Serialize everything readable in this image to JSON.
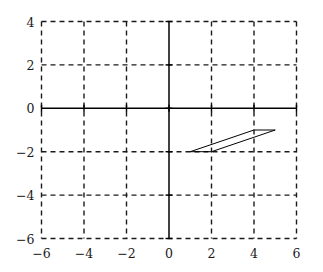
{
  "chart_data": {
    "type": "line",
    "title": "",
    "xlabel": "",
    "ylabel": "",
    "xlim": [
      -6,
      6
    ],
    "ylim": [
      -6,
      4
    ],
    "grid": true,
    "grid_style": "dashed",
    "grid_spacing": 2,
    "legend": "none",
    "axes_style": "solid-through-origin",
    "xticks": [
      -6,
      -4,
      -2,
      0,
      2,
      4,
      6
    ],
    "xtick_labels": [
      "−6",
      "−4",
      "−2",
      "0",
      "2",
      "4",
      "6"
    ],
    "yticks": [
      -6,
      -4,
      -2,
      0,
      2,
      4
    ],
    "ytick_labels": [
      "−6",
      "−4",
      "−2",
      "0",
      "2",
      "4"
    ],
    "series": [
      {
        "name": "parallelogram",
        "shape": "closed-polygon",
        "fill": "none",
        "stroke": "#000000",
        "stroke_width": 1,
        "points": [
          [
            1,
            -2
          ],
          [
            4,
            -1
          ],
          [
            5,
            -1
          ],
          [
            2,
            -2
          ]
        ]
      }
    ]
  },
  "colors": {
    "background": "#ffffff",
    "axis": "#000000",
    "grid": "#1a1a1a",
    "shape_stroke": "#000000",
    "tick_text": "#1a1a1a"
  }
}
